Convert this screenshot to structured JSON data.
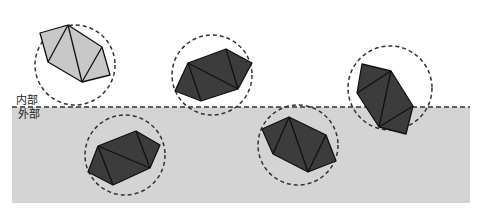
{
  "labels": {
    "inside": "内部",
    "outside": "外部"
  },
  "colors": {
    "outside_fill": "#d4d4d4",
    "light_poly": "#c8c8c8",
    "dark_poly": "#3c3c3c",
    "stroke": "#111111",
    "dashed": "#333333"
  },
  "shapes": [
    {
      "name": "light-hexagon",
      "state": "inside",
      "circle": {
        "cx": 75,
        "cy": 65,
        "r": 40
      }
    },
    {
      "name": "dark-hexagon-center",
      "state": "inside",
      "circle": {
        "cx": 212,
        "cy": 75,
        "r": 40
      }
    },
    {
      "name": "dark-hexagon-right",
      "state": "crossing",
      "circle": {
        "cx": 390,
        "cy": 88,
        "r": 42
      }
    },
    {
      "name": "dark-hexagon-bottom-left",
      "state": "outside",
      "circle": {
        "cx": 125,
        "cy": 155,
        "r": 40
      }
    },
    {
      "name": "dark-hexagon-bottom-middle",
      "state": "outside",
      "circle": {
        "cx": 298,
        "cy": 145,
        "r": 40
      }
    }
  ]
}
